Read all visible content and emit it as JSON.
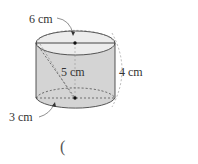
{
  "figure": {
    "shape": "cylinder",
    "labels": {
      "top_diameter": "6 cm",
      "slant": "5 cm",
      "height": "4 cm",
      "bottom_radius": "3 cm"
    },
    "answer_paren": "(",
    "colors": {
      "side_fill": "#d4d4d4",
      "top_fill": "#ececec",
      "stroke": "#333333"
    }
  }
}
